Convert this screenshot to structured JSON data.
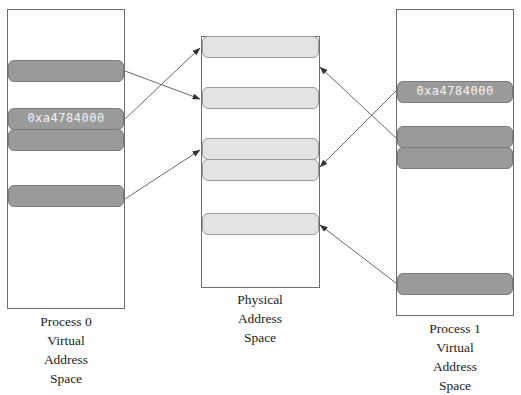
{
  "diagram": {
    "process0": {
      "caption": [
        "Process 0",
        "Virtual",
        "Address",
        "Space"
      ],
      "blocks": [
        {
          "label": ""
        },
        {
          "label": "0xa4784000"
        },
        {
          "label": ""
        },
        {
          "label": ""
        }
      ]
    },
    "physical": {
      "caption": [
        "Physical",
        "Address",
        "Space"
      ],
      "blocks": [
        {
          "label": ""
        },
        {
          "label": ""
        },
        {
          "label": ""
        },
        {
          "label": ""
        },
        {
          "label": ""
        }
      ]
    },
    "process1": {
      "caption": [
        "Process 1",
        "Virtual",
        "Address",
        "Space"
      ],
      "blocks": [
        {
          "label": "0xa4784000"
        },
        {
          "label": ""
        },
        {
          "label": ""
        },
        {
          "label": ""
        }
      ]
    },
    "mappings": [
      {
        "from": "process0.block0",
        "to": "physical.block1"
      },
      {
        "from": "process0.block1",
        "to": "physical.block0"
      },
      {
        "from": "process0.block3",
        "to": "physical.block2"
      },
      {
        "from": "process1.block0",
        "to": "physical.block3"
      },
      {
        "from": "process1.block1",
        "to": "physical.gap0"
      },
      {
        "from": "process1.block3",
        "to": "physical.block4"
      }
    ],
    "colors": {
      "virtual_block": "#9a9a9a",
      "physical_block": "#e3e3e3",
      "border": "#6e6e6e",
      "arrow": "#333333"
    }
  }
}
